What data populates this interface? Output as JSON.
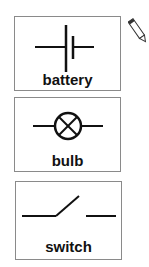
{
  "cards": [
    {
      "id": "battery",
      "label": "battery",
      "symbol": "battery-symbol-icon"
    },
    {
      "id": "bulb",
      "label": "bulb",
      "symbol": "bulb-symbol-icon"
    },
    {
      "id": "switch",
      "label": "switch",
      "symbol": "open-switch-symbol-icon"
    }
  ],
  "tools": {
    "pencil": "pencil-icon"
  },
  "colors": {
    "stroke": "#111111",
    "border": "#8a8a8a"
  }
}
